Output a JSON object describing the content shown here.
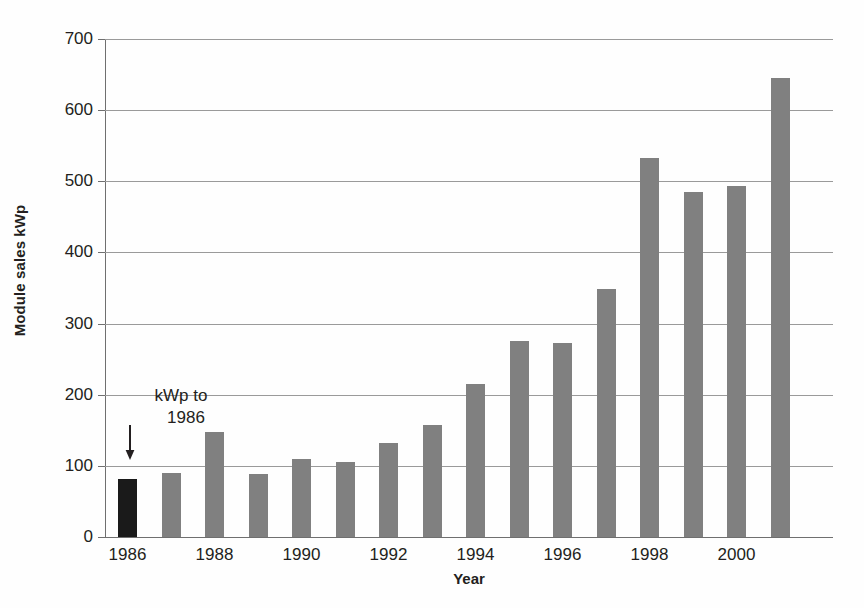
{
  "chart_data": {
    "type": "bar",
    "title": "",
    "subtitle": "",
    "xlabel": "Year",
    "ylabel": "Module sales kWp",
    "categories": [
      1986,
      1987,
      1988,
      1989,
      1990,
      1991,
      1992,
      1993,
      1994,
      1995,
      1996,
      1997,
      1998,
      1999,
      2000,
      2001
    ],
    "values": [
      82,
      90,
      148,
      88,
      110,
      105,
      132,
      157,
      215,
      275,
      273,
      348,
      533,
      485,
      493,
      645
    ],
    "xtick_labels": [
      "1986",
      "1988",
      "1990",
      "1992",
      "1994",
      "1996",
      "1998",
      "2000"
    ],
    "xtick_categories": [
      1986,
      1988,
      1990,
      1992,
      1994,
      1996,
      1998,
      2000
    ],
    "ytick_labels": [
      "0",
      "100",
      "200",
      "300",
      "400",
      "500",
      "600",
      "700"
    ],
    "ytick_values": [
      0,
      100,
      200,
      300,
      400,
      500,
      600,
      700
    ],
    "ylim": [
      0,
      700
    ],
    "grid": "horizontal",
    "legend": "none",
    "bar_color": "#808080",
    "highlight_color": "#1a1a1a",
    "highlighted_categories": [
      1986
    ],
    "annotations": [
      {
        "line1": "kWp to",
        "line2": "1986",
        "arrow": "down-arrow-icon",
        "points_to": 1986
      }
    ]
  }
}
